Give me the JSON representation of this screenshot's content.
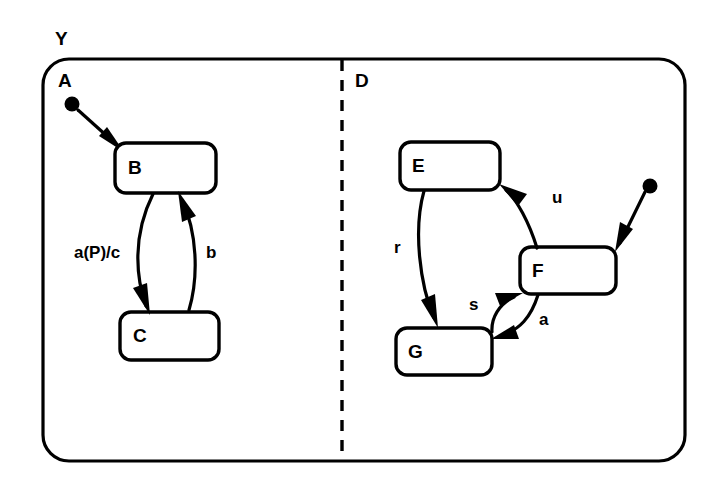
{
  "diagram": {
    "type": "statechart",
    "title_label": "Y",
    "outer_state": {
      "name": "Y",
      "label": "Y"
    },
    "regions": [
      {
        "id": "A",
        "label": "A",
        "side": "left"
      },
      {
        "id": "D",
        "label": "D",
        "side": "right"
      }
    ],
    "states": [
      {
        "id": "B",
        "label": "B",
        "region": "A"
      },
      {
        "id": "C",
        "label": "C",
        "region": "A"
      },
      {
        "id": "E",
        "label": "E",
        "region": "D"
      },
      {
        "id": "F",
        "label": "F",
        "region": "D"
      },
      {
        "id": "G",
        "label": "G",
        "region": "D"
      }
    ],
    "initial_states": [
      {
        "id": "init-A",
        "region": "A",
        "target": "B"
      },
      {
        "id": "init-D",
        "region": "D",
        "target": "F"
      }
    ],
    "transitions": [
      {
        "id": "t1",
        "from": "B",
        "to": "C",
        "label": "a(P)/c"
      },
      {
        "id": "t2",
        "from": "C",
        "to": "B",
        "label": "b"
      },
      {
        "id": "t3",
        "from": "E",
        "to": "G",
        "label": "r"
      },
      {
        "id": "t4",
        "from": "F",
        "to": "E",
        "label": "u"
      },
      {
        "id": "t5",
        "from": "G",
        "to": "F",
        "label": "s"
      },
      {
        "id": "t6",
        "from": "F",
        "to": "G",
        "label": "a"
      }
    ],
    "colors": {
      "stroke": "#000000",
      "background": "#ffffff",
      "fill": "#ffffff"
    }
  }
}
